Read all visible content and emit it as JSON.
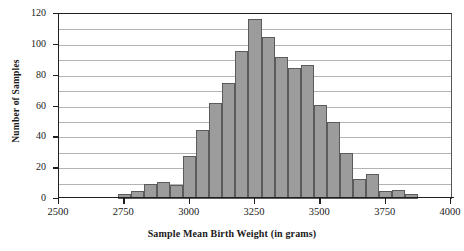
{
  "chart_data": {
    "type": "bar",
    "title": "",
    "xlabel": "Sample Mean Birth Weight (in grams)",
    "ylabel": "Number of Samples",
    "xlim": [
      2500,
      4000
    ],
    "ylim": [
      0,
      120
    ],
    "grid": true,
    "legend": "none",
    "bin_width": 50,
    "x_tick_labels": [
      "2500",
      "2750",
      "3000",
      "3250",
      "3500",
      "3750",
      "4000"
    ],
    "x_tick_values": [
      2500,
      2750,
      3000,
      3250,
      3500,
      3750,
      4000
    ],
    "y_tick_labels": [
      "0",
      "20",
      "40",
      "60",
      "80",
      "100",
      "120"
    ],
    "y_tick_values": [
      0,
      20,
      40,
      60,
      80,
      100,
      120
    ],
    "gridline_values": [
      10,
      20,
      30,
      40,
      50,
      60,
      70,
      80,
      90,
      100,
      110
    ],
    "bin_starts": [
      2725,
      2775,
      2825,
      2875,
      2925,
      2975,
      3025,
      3075,
      3125,
      3175,
      3225,
      3275,
      3325,
      3375,
      3425,
      3475,
      3525,
      3575,
      3625,
      3675,
      3725,
      3775,
      3825
    ],
    "values": [
      3,
      5,
      10,
      11,
      9,
      28,
      45,
      62,
      75,
      96,
      117,
      105,
      92,
      85,
      87,
      61,
      50,
      30,
      13,
      16,
      5,
      6,
      3
    ],
    "bar_fill_color": "#9c9c9c",
    "bar_edge_color": "#5b5b5b",
    "axis_color": "#1f1f1f",
    "grid_color": "#9a9a9a"
  }
}
